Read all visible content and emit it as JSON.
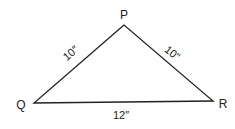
{
  "diagram": {
    "type": "triangle",
    "vertices": {
      "P": {
        "label": "P",
        "x": 124,
        "y": 25
      },
      "Q": {
        "label": "Q",
        "x": 34,
        "y": 103
      },
      "R": {
        "label": "R",
        "x": 213,
        "y": 101
      }
    },
    "sides": {
      "PQ": {
        "label": "10″"
      },
      "PR": {
        "label": "10″"
      },
      "QR": {
        "label": "12″"
      }
    },
    "colors": {
      "stroke": "#222222",
      "background": "#ffffff"
    }
  }
}
